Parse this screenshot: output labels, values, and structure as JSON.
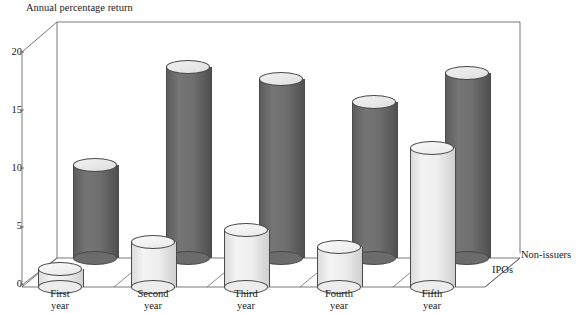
{
  "chart_data": {
    "type": "bar",
    "title": "Annual percentage return",
    "xlabel": "",
    "ylabel": "Annual percentage return",
    "categories": [
      "First year",
      "Second year",
      "Third year",
      "Fourth year",
      "Fifth year"
    ],
    "category_lines": [
      [
        "First",
        "year"
      ],
      [
        "Second",
        "year"
      ],
      [
        "Third",
        "year"
      ],
      [
        "Fourth",
        "year"
      ],
      [
        "Fifth",
        "year"
      ]
    ],
    "series": [
      {
        "name": "Non-issuers",
        "values": [
          8.6,
          17.0,
          16.0,
          14.0,
          16.5
        ],
        "color": "#6b6b6b"
      },
      {
        "name": "IPOs",
        "values": [
          2.0,
          4.5,
          5.5,
          4.0,
          12.5
        ],
        "color": "#ececec"
      }
    ],
    "ylim": [
      0,
      20
    ],
    "yticks": [
      0,
      5,
      10,
      15,
      20
    ],
    "ytick_labels": [
      "0",
      "5",
      "10",
      "15",
      "20"
    ],
    "grid": false,
    "legend_position": "right",
    "projection": "3d-cylinders"
  },
  "legend": {
    "entries": [
      {
        "label": "Non-issuers",
        "series": "Non-issuers"
      },
      {
        "label": "IPOs",
        "series": "IPOs"
      }
    ]
  },
  "axes": {
    "y_title": "Annual percentage return",
    "tick_0": "0",
    "tick_5": "5",
    "tick_10": "10",
    "tick_15": "15",
    "tick_20": "20"
  }
}
